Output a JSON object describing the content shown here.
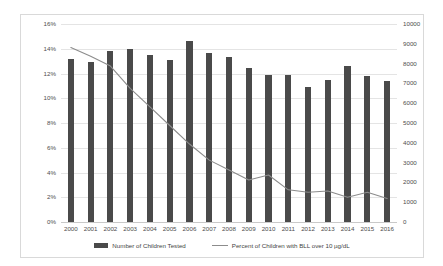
{
  "chart_data": {
    "type": "bar",
    "title": "",
    "subtitle": "",
    "xlabel": "",
    "ylabel": "",
    "grid": true,
    "legend_position": "bottom",
    "categories": [
      "2000",
      "2001",
      "2002",
      "2003",
      "2004",
      "2005",
      "2006",
      "2007",
      "2008",
      "2009",
      "2010",
      "2011",
      "2012",
      "2013",
      "2014",
      "2015",
      "2016"
    ],
    "left_axis": {
      "label": "",
      "ylim": [
        0,
        16
      ],
      "tick_values": [
        0,
        2,
        4,
        6,
        8,
        10,
        12,
        14,
        16
      ],
      "tick_labels": [
        "0%",
        "2%",
        "4%",
        "6%",
        "8%",
        "10%",
        "12%",
        "14%",
        "16%"
      ],
      "unit": "%"
    },
    "right_axis": {
      "label": "",
      "ylim": [
        0,
        10000
      ],
      "tick_values": [
        0,
        1000,
        2000,
        3000,
        4000,
        5000,
        6000,
        7000,
        8000,
        9000,
        10000
      ],
      "tick_labels": [
        "0",
        "1000",
        "2000",
        "3000",
        "4000",
        "5000",
        "6000",
        "7000",
        "8000",
        "9000",
        "10000"
      ]
    },
    "series": [
      {
        "name": "Number of Children Tested",
        "type": "bar",
        "axis": "right",
        "color": "#4a4a4a",
        "values": [
          8250,
          8100,
          8650,
          8750,
          8450,
          8200,
          9150,
          8550,
          8350,
          7800,
          7400,
          7450,
          6800,
          7150,
          7900,
          7350,
          7100
        ]
      },
      {
        "name": "Percent of Children with BLL over 10 µg/dL",
        "type": "line",
        "axis": "left",
        "color": "#8c8c8c",
        "values": [
          14.1,
          13.4,
          12.6,
          10.8,
          9.3,
          7.8,
          6.3,
          5.0,
          4.2,
          3.4,
          3.8,
          2.6,
          2.4,
          2.5,
          2.0,
          2.4,
          1.9
        ]
      }
    ]
  },
  "legend": {
    "items": [
      {
        "label": "Number of Children Tested",
        "marker": "bar-swatch",
        "color": "#4a4a4a"
      },
      {
        "label": "Percent of Children with BLL over 10 µg/dL",
        "marker": "line-swatch",
        "color": "#8c8c8c"
      }
    ]
  },
  "colors": {
    "bar": "#4a4a4a",
    "line": "#8c8c8c",
    "gridline": "#e4e4e4",
    "frame_border": "#d9d9d9",
    "tick_text": "#4d4d4d",
    "background": "#ffffff"
  }
}
